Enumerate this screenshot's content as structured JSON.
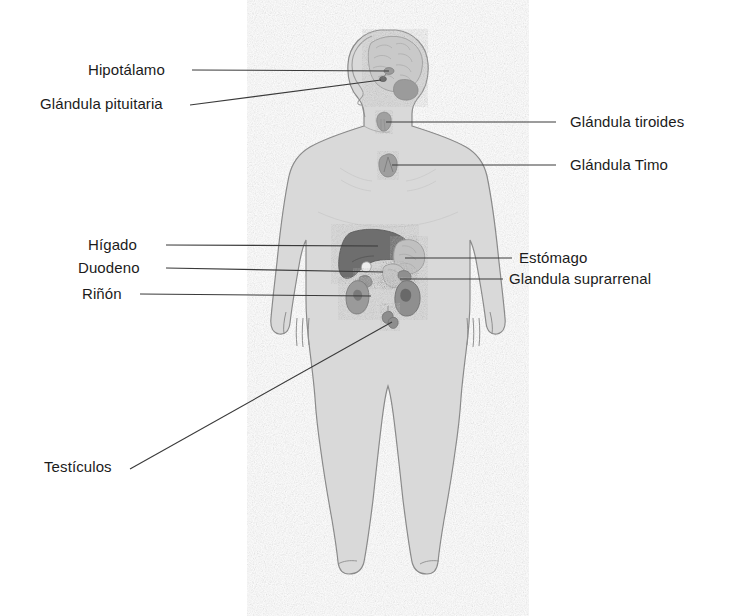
{
  "figure": {
    "view": "frontal",
    "background_color": "#ffffff",
    "body_fill_color": "#d9d9d9",
    "body_outline_color": "#8a8a8a",
    "organ_dark_color": "#6e6e6e",
    "organ_mid_color": "#9a9a9a",
    "organ_light_color": "#c2c2c2",
    "leader_line_color": "#3a3a3a",
    "text_color": "#1b1b1b"
  },
  "labels": [
    {
      "id": "hipotalamo",
      "text": "Hipotálamo",
      "side": "left",
      "text_x": 88,
      "text_y": 61,
      "line": {
        "x1": 192,
        "y1": 70,
        "x2": 389,
        "y2": 71
      },
      "organ": "hipotálamo"
    },
    {
      "id": "glandula-pituitaria",
      "text": "Glándula pituitaria",
      "side": "left",
      "text_x": 40,
      "text_y": 95,
      "line": {
        "x1": 190,
        "y1": 105,
        "x2": 381,
        "y2": 80
      },
      "organ": "glándula pituitaria (hipófisis)"
    },
    {
      "id": "glandula-tiroides",
      "text": "Glándula tiroides",
      "side": "right",
      "text_x": 570,
      "text_y": 113,
      "line": {
        "x1": 386,
        "y1": 122,
        "x2": 556,
        "y2": 122
      },
      "organ": "glándula tiroides"
    },
    {
      "id": "glandula-timo",
      "text": "Glándula Timo",
      "side": "right",
      "text_x": 570,
      "text_y": 156,
      "line": {
        "x1": 392,
        "y1": 165,
        "x2": 556,
        "y2": 165
      },
      "organ": "glándula timo"
    },
    {
      "id": "higado",
      "text": "Hígado",
      "side": "left",
      "text_x": 88,
      "text_y": 236,
      "line": {
        "x1": 166,
        "y1": 245,
        "x2": 378,
        "y2": 246
      },
      "organ": "hígado"
    },
    {
      "id": "duodeno",
      "text": "Duodeno",
      "side": "left",
      "text_x": 78,
      "text_y": 259,
      "line": {
        "x1": 166,
        "y1": 268,
        "x2": 383,
        "y2": 272
      },
      "organ": "duodeno"
    },
    {
      "id": "rinon",
      "text": "Riñón",
      "side": "left",
      "text_x": 82,
      "text_y": 285,
      "line": {
        "x1": 140,
        "y1": 294,
        "x2": 371,
        "y2": 296
      },
      "organ": "riñón"
    },
    {
      "id": "estomago",
      "text": "Estómago",
      "side": "right",
      "text_x": 519,
      "text_y": 249,
      "line": {
        "x1": 405,
        "y1": 258,
        "x2": 512,
        "y2": 258
      },
      "organ": "estómago"
    },
    {
      "id": "glandula-suprarrenal",
      "text": "Glandula suprarrenal",
      "side": "right",
      "text_x": 509,
      "text_y": 270,
      "line": {
        "x1": 400,
        "y1": 279,
        "x2": 503,
        "y2": 279
      },
      "organ": "glándula suprarrenal"
    },
    {
      "id": "testiculos",
      "text": "Testículos",
      "side": "left",
      "text_x": 44,
      "text_y": 458,
      "line": {
        "x1": 130,
        "y1": 469,
        "x2": 392,
        "y2": 322
      },
      "organ": "testículos"
    }
  ],
  "organs": [
    {
      "id": "brain",
      "name": "cerebro",
      "shade": "light"
    },
    {
      "id": "hypothalamus",
      "name": "hipotálamo",
      "shade": "mid"
    },
    {
      "id": "pituitary",
      "name": "glándula pituitaria",
      "shade": "dark"
    },
    {
      "id": "thyroid",
      "name": "glándula tiroides",
      "shade": "mid"
    },
    {
      "id": "thymus",
      "name": "glándula timo",
      "shade": "mid"
    },
    {
      "id": "liver",
      "name": "hígado",
      "shade": "dark"
    },
    {
      "id": "stomach",
      "name": "estómago",
      "shade": "light"
    },
    {
      "id": "duodenum",
      "name": "duodeno",
      "shade": "light"
    },
    {
      "id": "kidney",
      "name": "riñón",
      "shade": "mid"
    },
    {
      "id": "adrenal",
      "name": "glándula suprarrenal",
      "shade": "mid"
    },
    {
      "id": "testes",
      "name": "testículos",
      "shade": "mid"
    }
  ]
}
